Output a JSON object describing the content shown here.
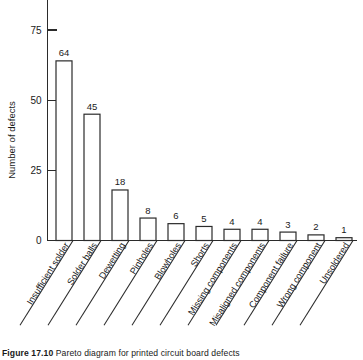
{
  "figure": {
    "caption_number": "Figure 17.10",
    "caption_text": "Pareto diagram for printed circuit board defects"
  },
  "chart_data": {
    "type": "bar",
    "title": "",
    "subtitle": "",
    "xlabel": "",
    "ylabel": "Number of defects",
    "ylim": [
      0,
      80
    ],
    "yticks": [
      0,
      25,
      50,
      75
    ],
    "ytick_labels": [
      "0",
      "25",
      "50",
      "75"
    ],
    "grid": false,
    "legend": false,
    "categories": [
      "Insufficient solder",
      "Solder balls",
      "Dewetting",
      "Pinholes",
      "Blowholes",
      "Shorts",
      "Missing components",
      "Misaligned components",
      "Component failure",
      "Wrong component",
      "Unsoldered"
    ],
    "values": [
      64,
      45,
      18,
      8,
      6,
      5,
      4,
      4,
      3,
      2,
      1
    ],
    "value_labels": [
      "64",
      "45",
      "18",
      "8",
      "6",
      "5",
      "4",
      "4",
      "3",
      "2",
      "1"
    ],
    "bar_fill": "#ffffff",
    "bar_stroke": "#2b2b2b",
    "axis_color": "#2b2b2b"
  }
}
